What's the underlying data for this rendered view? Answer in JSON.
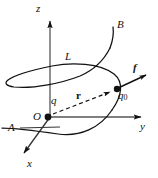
{
  "figure": {
    "type": "physics-vector-diagram",
    "background_color": "#ffffff",
    "stroke_color": "#111111",
    "axes": {
      "z": {
        "label": "z",
        "direction": "up",
        "arrow": true
      },
      "y": {
        "label": "y",
        "direction": "right",
        "arrow": true
      },
      "x": {
        "label": "x",
        "direction": "down-left",
        "arrow": true
      }
    },
    "points": [
      {
        "name": "origin",
        "label": "O",
        "marker": "filled-dot",
        "note": "location of source charge"
      },
      {
        "name": "source-charge",
        "label": "q",
        "marker": "none"
      },
      {
        "name": "test-charge",
        "label": "q",
        "subscript": "0",
        "marker": "filled-dot"
      }
    ],
    "vectors": [
      {
        "name": "position-vector",
        "label": "r",
        "style": "dashed-arrow",
        "bold": true,
        "from": "O",
        "to": "q0"
      },
      {
        "name": "force-vector",
        "label": "f",
        "style": "solid-arrow",
        "bold": true,
        "from": "q0",
        "to": "outward-up-right"
      }
    ],
    "curves": [
      {
        "name": "field-line",
        "label": "L",
        "endpoint_start": "A",
        "endpoint_end": "B",
        "style": "solid"
      },
      {
        "name": "field-line-start-label",
        "label": "A"
      },
      {
        "name": "field-line-end-label",
        "label": "B"
      }
    ],
    "labels": {
      "z_axis": "z",
      "y_axis": "y",
      "x_axis": "x",
      "origin": "O",
      "source_charge": "q",
      "test_charge": "q",
      "test_charge_subscript": "0",
      "position_vector": "r",
      "force_vector": "f",
      "curve": "L",
      "curve_start": "A",
      "curve_end": "B"
    }
  }
}
